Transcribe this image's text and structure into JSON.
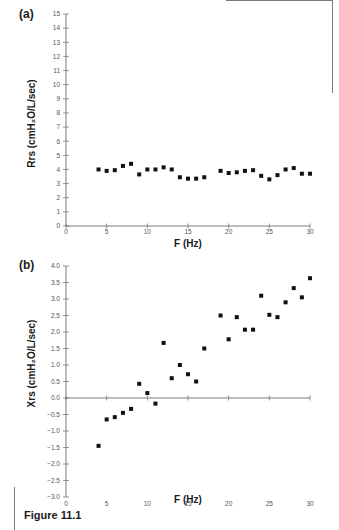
{
  "figure": {
    "caption": "Figure 11.1"
  },
  "panels": {
    "a": {
      "label": "(a)",
      "ylabel": "Rrs (cmH₂O/L/sec)",
      "xlabel": "F (Hz)"
    },
    "b": {
      "label": "(b)",
      "ylabel": "Xrs (cmH₂O/L/sec)",
      "xlabel": "F (Hz)"
    }
  },
  "chart_data": [
    {
      "type": "scatter",
      "panel": "(a)",
      "title": "",
      "xlabel": "F (Hz)",
      "ylabel": "Rrs (cmH2O/L/sec)",
      "xlim": [
        0,
        30
      ],
      "ylim": [
        0,
        15
      ],
      "xticks": [
        0,
        5,
        10,
        15,
        20,
        25,
        30
      ],
      "yticks": [
        0,
        1,
        2,
        3,
        4,
        5,
        6,
        7,
        8,
        9,
        10,
        11,
        12,
        13,
        14,
        15
      ],
      "grid": false,
      "legend": null,
      "x": [
        4,
        5,
        6,
        7,
        8,
        9,
        10,
        11,
        12,
        13,
        14,
        15,
        16,
        17,
        19,
        20,
        21,
        22,
        23,
        24,
        25,
        26,
        27,
        28,
        29,
        30
      ],
      "y": [
        4.0,
        3.9,
        3.95,
        4.25,
        4.4,
        3.65,
        4.0,
        4.0,
        4.15,
        4.0,
        3.45,
        3.35,
        3.35,
        3.45,
        3.9,
        3.75,
        3.8,
        3.9,
        3.95,
        3.55,
        3.3,
        3.6,
        4.0,
        4.1,
        3.7,
        3.7
      ]
    },
    {
      "type": "scatter",
      "panel": "(b)",
      "title": "",
      "xlabel": "F (Hz)",
      "ylabel": "Xrs (cmH2O/L/sec)",
      "xlim": [
        0,
        30
      ],
      "ylim": [
        -3.0,
        4.0
      ],
      "xticks": [
        0,
        5,
        10,
        15,
        20,
        25,
        30
      ],
      "yticks": [
        -3.0,
        -2.5,
        -2.0,
        -1.5,
        -1.0,
        -0.5,
        0.0,
        0.5,
        1.0,
        1.5,
        2.0,
        2.5,
        3.0,
        3.5,
        4.0
      ],
      "grid": false,
      "legend": null,
      "x": [
        4,
        5,
        6,
        7,
        8,
        9,
        10,
        11,
        12,
        13,
        14,
        15,
        16,
        17,
        19,
        20,
        21,
        22,
        23,
        24,
        25,
        26,
        27,
        28,
        29,
        30
      ],
      "y": [
        -1.45,
        -0.65,
        -0.58,
        -0.45,
        -0.33,
        0.43,
        0.15,
        -0.17,
        1.67,
        0.6,
        1.0,
        0.72,
        0.5,
        1.5,
        2.5,
        1.78,
        2.45,
        2.07,
        2.07,
        3.1,
        2.52,
        2.45,
        2.9,
        3.33,
        3.05,
        3.63
      ]
    }
  ]
}
